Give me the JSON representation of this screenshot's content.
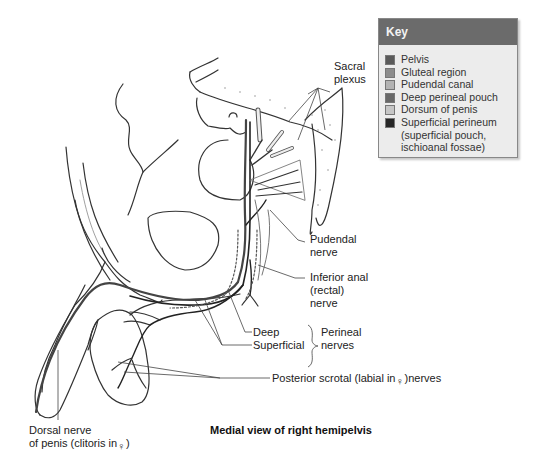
{
  "figure": {
    "caption": "Medial view of right hemipelvis"
  },
  "key": {
    "title": "Key",
    "items": [
      {
        "label": "Pelvis",
        "color": "#5a5a5a"
      },
      {
        "label": "Gluteal region",
        "color": "#8c8c8c"
      },
      {
        "label": "Pudendal canal",
        "color": "#b4b4b4"
      },
      {
        "label": "Deep perineal pouch",
        "color": "#686868"
      },
      {
        "label": "Dorsum of penis",
        "color": "#c6c6c6"
      },
      {
        "label": "Superficial perineum",
        "color": "#262626",
        "sub": [
          "(superficial pouch,",
          "ischioanal fossae)"
        ]
      }
    ]
  },
  "labels": {
    "sacral_plexus": [
      "Sacral",
      "plexus"
    ],
    "pudendal_nerve": [
      "Pudendal",
      "nerve"
    ],
    "inferior_anal": [
      "Inferior anal",
      "(rectal)",
      "nerve"
    ],
    "deep": "Deep",
    "superficial": "Superficial",
    "perineal_nerves": [
      "Perineal",
      "nerves"
    ],
    "posterior_scrotal": {
      "before": "Posterior scrotal (labial in",
      "symbol": "♀",
      "after": ")nerves"
    },
    "dorsal_nerve": {
      "line1": "Dorsal nerve",
      "line2_before": "of penis (clitoris in",
      "symbol": "♀",
      "line2_after": ")"
    }
  }
}
